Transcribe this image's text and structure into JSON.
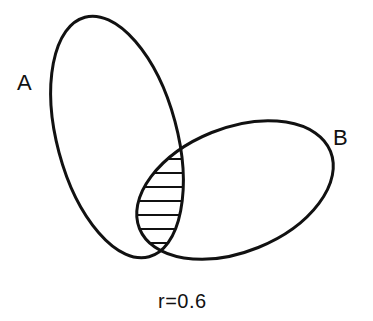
{
  "diagram": {
    "type": "venn",
    "sets": [
      {
        "id": "A",
        "label": "A"
      },
      {
        "id": "B",
        "label": "B"
      }
    ],
    "intersection": {
      "sets": [
        "A",
        "B"
      ],
      "style": "horizontal-hatch"
    },
    "caption": "r=0.6"
  },
  "colors": {
    "stroke": "#111111",
    "background": "#ffffff"
  }
}
